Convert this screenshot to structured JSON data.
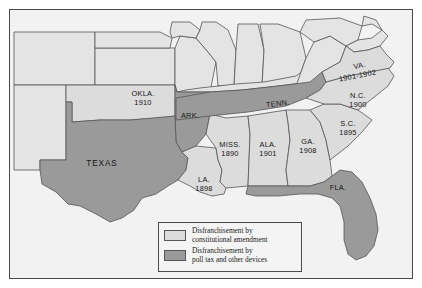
{
  "figure": {
    "frame_color": "#4a4a4a",
    "background_color": "#f2f2f2"
  },
  "colors": {
    "constitutional_amendment": "#dcdcdc",
    "poll_tax_other_devices": "#9a9a9a",
    "unshaded_state": "#e4e4e4",
    "outline": "#55555a",
    "water": "#f2f2f2"
  },
  "legend": {
    "items": [
      {
        "swatch": "light",
        "line1": "Disfranchisement by",
        "line2": "constitutional amendment"
      },
      {
        "swatch": "dark",
        "line1": "Disfranchisement by",
        "line2": "poll tax and other devices"
      }
    ]
  },
  "map_data": {
    "type": "choropleth",
    "region": "Southern United States",
    "categories": [
      "Disfranchisement by constitutional amendment",
      "Disfranchisement by poll tax and other devices"
    ],
    "states": [
      {
        "abbr": "OKLA.",
        "year": "1910",
        "category": "constitutional amendment",
        "label_x": 133,
        "label_y": 86
      },
      {
        "abbr": "ARK.",
        "year": "",
        "category": "poll tax and other devices",
        "label_x": 180,
        "label_y": 106
      },
      {
        "abbr": "TEXAS",
        "year": "",
        "category": "poll tax and other devices",
        "label_x": 92,
        "label_y": 154
      },
      {
        "abbr": "LA.",
        "year": "1898",
        "category": "constitutional amendment",
        "label_x": 194,
        "label_y": 174
      },
      {
        "abbr": "MISS.",
        "year": "1890",
        "category": "constitutional amendment",
        "label_x": 222,
        "label_y": 137
      },
      {
        "abbr": "ALA.",
        "year": "1901",
        "category": "constitutional amendment",
        "label_x": 259,
        "label_y": 137
      },
      {
        "abbr": "TENN.",
        "year": "",
        "category": "poll tax and other devices",
        "label_x": 275,
        "label_y": 96
      },
      {
        "abbr": "GA.",
        "year": "1908",
        "category": "constitutional amendment",
        "label_x": 300,
        "label_y": 134
      },
      {
        "abbr": "FLA.",
        "year": "",
        "category": "poll tax and other devices",
        "label_x": 332,
        "label_y": 180
      },
      {
        "abbr": "S.C.",
        "year": "1895",
        "category": "constitutional amendment",
        "label_x": 339,
        "label_y": 116
      },
      {
        "abbr": "N.C.",
        "year": "1900",
        "category": "constitutional amendment",
        "label_x": 349,
        "label_y": 90
      },
      {
        "abbr": "VA.",
        "year": "1901-1902",
        "category": "constitutional amendment",
        "label_x": 349,
        "label_y": 63
      }
    ]
  }
}
